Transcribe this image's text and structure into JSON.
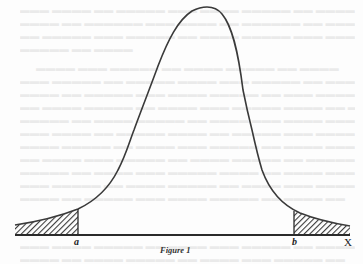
{
  "figure": {
    "caption": "Figure 1",
    "type": "normal-distribution-curve",
    "labels": {
      "left_bound": "a",
      "right_bound": "b",
      "axis": "X"
    },
    "shaded_regions": [
      "left-tail (x < a)",
      "right-tail (x > b)"
    ],
    "colors": {
      "curve": "#3a3a3a",
      "axis": "#2a2a2a",
      "hatch": "#3a3a3a",
      "background": "#fdfdfd"
    }
  },
  "bleed_through_text": {
    "description": "faint illegible text showing through from reverse side of page",
    "lines": [
      "                                                              ",
      "                                                              ",
      "                                                              ",
      "                                                              "
    ]
  }
}
